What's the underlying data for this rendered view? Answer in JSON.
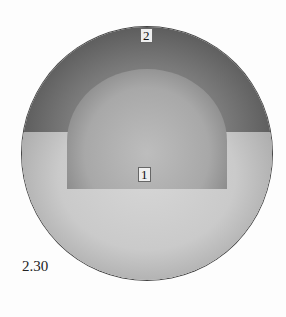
{
  "figure": {
    "number_label": "2.30",
    "regions": [
      {
        "id": "1",
        "label": "1"
      },
      {
        "id": "2",
        "label": "2"
      }
    ]
  }
}
